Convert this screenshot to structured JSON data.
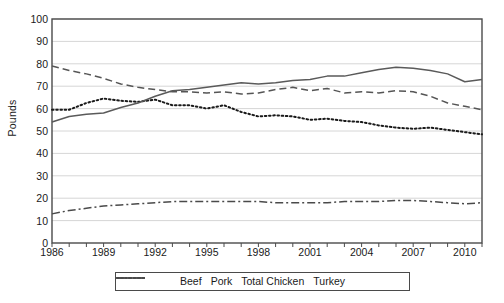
{
  "chart_data": {
    "type": "line",
    "title": "",
    "xlabel": "",
    "ylabel": "Pounds",
    "ylim": [
      0,
      100
    ],
    "ytick_step": 10,
    "yticks": [
      0,
      10,
      20,
      30,
      40,
      50,
      60,
      70,
      80,
      90,
      100
    ],
    "xlim": [
      1986,
      2011
    ],
    "x": [
      1986,
      1987,
      1988,
      1989,
      1990,
      1991,
      1992,
      1993,
      1994,
      1995,
      1996,
      1997,
      1998,
      1999,
      2000,
      2001,
      2002,
      2003,
      2004,
      2005,
      2006,
      2007,
      2008,
      2009,
      2010,
      2011
    ],
    "xtick_labels": [
      "1986",
      "1989",
      "1992",
      "1995",
      "1998",
      "2001",
      "2004",
      "2007",
      "2010"
    ],
    "xtick_label_years": [
      1986,
      1989,
      1992,
      1995,
      1998,
      2001,
      2004,
      2007,
      2010
    ],
    "xticks_all_years": true,
    "grid": "horizontal",
    "legend_position": "bottom",
    "series": [
      {
        "name": "Beef",
        "style": "dashed",
        "color": "#555555",
        "values": [
          79.0,
          77.0,
          75.5,
          73.5,
          71.0,
          69.5,
          68.5,
          67.5,
          67.5,
          67.0,
          67.5,
          66.5,
          67.0,
          68.5,
          69.5,
          68.0,
          69.0,
          67.0,
          67.5,
          67.0,
          68.0,
          67.5,
          65.5,
          62.5,
          61.0,
          59.5
        ]
      },
      {
        "name": "Pork",
        "style": "dotted",
        "color": "#1a1a1a",
        "values": [
          59.5,
          59.5,
          62.5,
          64.5,
          63.5,
          63.0,
          64.0,
          61.5,
          61.5,
          60.0,
          61.5,
          58.5,
          56.5,
          57.0,
          56.5,
          55.0,
          55.5,
          54.5,
          54.0,
          52.5,
          51.5,
          51.0,
          51.5,
          50.5,
          49.5,
          48.5
        ]
      },
      {
        "name": "Total Chicken",
        "style": "solid",
        "color": "#5a5a5a",
        "values": [
          54.0,
          56.5,
          57.5,
          58.0,
          60.5,
          62.5,
          65.5,
          68.0,
          68.5,
          69.5,
          70.5,
          71.5,
          71.0,
          71.5,
          72.5,
          73.0,
          74.5,
          74.5,
          76.0,
          77.5,
          78.5,
          78.0,
          77.0,
          75.5,
          72.0,
          73.0
        ]
      },
      {
        "name": "Turkey",
        "style": "dashdot",
        "color": "#4a4a4a",
        "values": [
          13.0,
          14.5,
          15.5,
          16.5,
          17.0,
          17.5,
          18.0,
          18.5,
          18.5,
          18.5,
          18.5,
          18.5,
          18.5,
          18.0,
          18.0,
          18.0,
          18.0,
          18.5,
          18.5,
          18.5,
          19.0,
          19.0,
          18.5,
          18.0,
          17.5,
          18.0
        ]
      }
    ]
  },
  "legend": {
    "items": [
      {
        "label": "Beef"
      },
      {
        "label": "Pork"
      },
      {
        "label": "Total Chicken"
      },
      {
        "label": "Turkey"
      }
    ]
  }
}
